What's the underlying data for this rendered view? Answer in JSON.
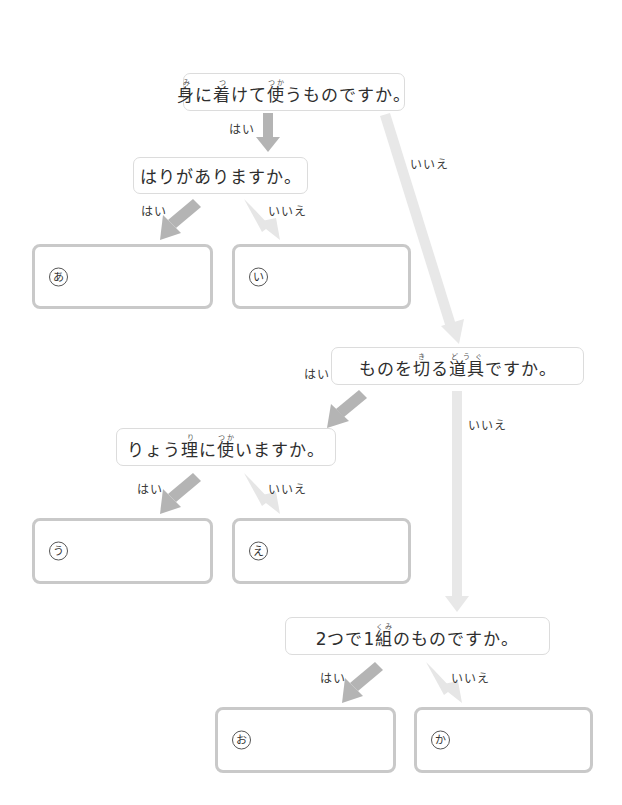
{
  "questions": {
    "q1": {
      "parts": [
        {
          "base": "身",
          "ruby": "み"
        },
        {
          "text": "に"
        },
        {
          "base": "着",
          "ruby": "つ"
        },
        {
          "text": "けて"
        },
        {
          "base": "使",
          "ruby": "つか"
        },
        {
          "text": "うものですか。"
        }
      ]
    },
    "q2": {
      "text": "はりがありますか。"
    },
    "q3": {
      "parts": [
        {
          "text": "ものを"
        },
        {
          "base": "切",
          "ruby": "き"
        },
        {
          "text": "る"
        },
        {
          "base": "道具",
          "ruby": "どうぐ"
        },
        {
          "text": "ですか。"
        }
      ]
    },
    "q4": {
      "parts": [
        {
          "text": "りょう"
        },
        {
          "base": "理",
          "ruby": "り"
        },
        {
          "text": "に"
        },
        {
          "base": "使",
          "ruby": "つか"
        },
        {
          "text": "いますか。"
        }
      ]
    },
    "q5": {
      "parts": [
        {
          "text": "2つで1"
        },
        {
          "base": "組",
          "ruby": "くみ"
        },
        {
          "text": "のものですか。"
        }
      ]
    }
  },
  "labels": {
    "yes": "はい",
    "no": "いいえ"
  },
  "answers": {
    "a": "あ",
    "i": "い",
    "u": "う",
    "e": "え",
    "o": "お",
    "ka": "か"
  },
  "colors": {
    "yes_arrow": "#b4b4b4",
    "no_arrow": "#e6e6e6",
    "answer_border": "#c9c9c9",
    "question_border": "#dcdcdc"
  }
}
